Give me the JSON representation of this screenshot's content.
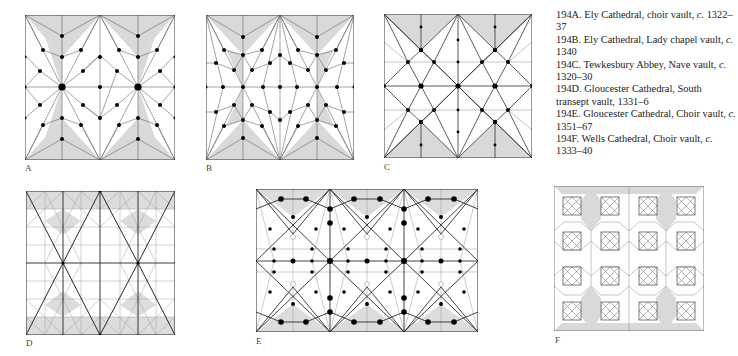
{
  "figure": {
    "panels": [
      {
        "id": "A",
        "label": "A"
      },
      {
        "id": "B",
        "label": "B"
      },
      {
        "id": "C",
        "label": "C"
      },
      {
        "id": "D",
        "label": "D"
      },
      {
        "id": "E",
        "label": "E"
      },
      {
        "id": "F",
        "label": "F"
      }
    ],
    "captions": [
      {
        "num": "194A.",
        "text": "Ely Cathedral, choir vault,",
        "circa": "c.",
        "date": "1322–37"
      },
      {
        "num": "194B.",
        "text": "Ely Cathedral, Lady chapel vault,",
        "circa": "c.",
        "date": "1340"
      },
      {
        "num": "194C.",
        "text": "Tewkesbury Abbey, Nave vault,",
        "circa": "c.",
        "date": "1320–30"
      },
      {
        "num": "194D.",
        "text": "Gloucester Cathedral, South transept vault,",
        "circa": "",
        "date": "1331–6"
      },
      {
        "num": "194E.",
        "text": "Gloucester Cathedral, Choir vault,",
        "circa": "c.",
        "date": "1351–67"
      },
      {
        "num": "194F.",
        "text": "Wells Cathedral, Choir vault,",
        "circa": "c.",
        "date": "1333–40"
      }
    ],
    "colors": {
      "shade": "#d9d9d9",
      "line": "#555555",
      "rib": "#222222",
      "boss": "#000000"
    }
  }
}
